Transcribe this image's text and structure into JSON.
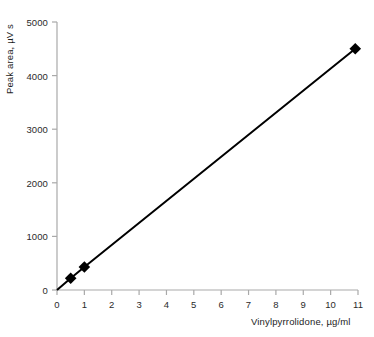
{
  "chart_data": {
    "type": "line",
    "title": "",
    "subtitle": "",
    "xlabel": "Vinylpyrrolidone, µg/ml",
    "ylabel": "Peak area, µV s",
    "xlim": [
      0,
      11
    ],
    "ylim": [
      0,
      5000
    ],
    "xticks": [
      0,
      1,
      2,
      3,
      4,
      5,
      6,
      7,
      8,
      9,
      10,
      11
    ],
    "xtick_labels": [
      "0",
      "1",
      "2",
      "3",
      "4",
      "5",
      "6",
      "7",
      "8",
      "9",
      "10",
      "11"
    ],
    "yticks": [
      0,
      1000,
      2000,
      3000,
      4000,
      5000
    ],
    "ytick_labels": [
      "0",
      "1000",
      "2000",
      "3000",
      "4000",
      "5000"
    ],
    "grid": false,
    "legend": null,
    "legend_position": "none",
    "annotations": [],
    "series": [
      {
        "name": "Vinylpyrrolidone calibration",
        "marker": "square",
        "marker_color": "#000000",
        "line_color": "#000000",
        "line_width": 2,
        "x": [
          0,
          0.5,
          1.0,
          10.9
        ],
        "y": [
          0,
          220,
          430,
          4500
        ],
        "points": [
          {
            "x": 0,
            "y": 0,
            "marker": false
          },
          {
            "x": 0.5,
            "y": 220,
            "marker": true
          },
          {
            "x": 1.0,
            "y": 430,
            "marker": true
          },
          {
            "x": 10.9,
            "y": 4500,
            "marker": true
          }
        ]
      }
    ]
  },
  "style": {
    "axis_color": "#a9a9a9",
    "tick_color": "#a9a9a9",
    "text_color": "#1d1d1d",
    "background": "#ffffff",
    "data_color": "#000000"
  }
}
